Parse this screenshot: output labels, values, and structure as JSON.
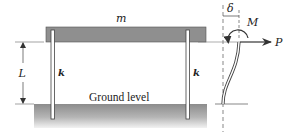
{
  "diagram": {
    "labels": {
      "mass": "m",
      "length": "L",
      "stiffness_left": "k",
      "stiffness_right": "k",
      "ground": "Ground level",
      "deflection": "δ",
      "moment": "M",
      "force": "P"
    },
    "colors": {
      "beam_fill": "#8a8a8a",
      "ground_top": "#8f8f8f",
      "ground_bottom": "#e8e8e8",
      "line": "#333333"
    }
  }
}
